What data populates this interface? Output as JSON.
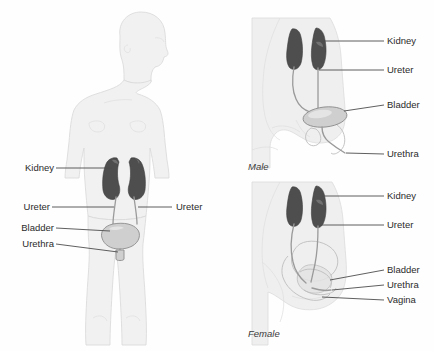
{
  "figure": {
    "background_color": "#ffffff",
    "label_color": "#2b2b2b",
    "leader_color": "#4d4d4d",
    "organ_colors": {
      "kidney": "#4e4e4e",
      "ureter": "#9a9a9a",
      "bladder": "#cfcfcf",
      "urethra": "#9a9a9a",
      "body": "#f1f1f1"
    }
  },
  "panels": {
    "full_body": {
      "caption": "",
      "labels_left": [
        {
          "text": "Kidney",
          "x": 20,
          "y": 171
        },
        {
          "text": "Ureter",
          "x": 20,
          "y": 210
        },
        {
          "text": "Bladder",
          "x": 16,
          "y": 231
        },
        {
          "text": "Urethra",
          "x": 16,
          "y": 247
        }
      ],
      "labels_right": [
        {
          "text": "Ureter",
          "x": 176,
          "y": 210
        }
      ]
    },
    "male": {
      "caption": "Male",
      "caption_x": 248,
      "caption_y": 170,
      "labels": [
        {
          "text": "Kidney",
          "x": 387,
          "y": 44
        },
        {
          "text": "Ureter",
          "x": 387,
          "y": 73
        },
        {
          "text": "Bladder",
          "x": 387,
          "y": 108
        },
        {
          "text": "Urethra",
          "x": 387,
          "y": 157
        }
      ]
    },
    "female": {
      "caption": "Female",
      "caption_x": 248,
      "caption_y": 337,
      "labels": [
        {
          "text": "Kidney",
          "x": 387,
          "y": 199
        },
        {
          "text": "Ureter",
          "x": 387,
          "y": 228
        },
        {
          "text": "Bladder",
          "x": 387,
          "y": 273
        },
        {
          "text": "Urethra",
          "x": 387,
          "y": 288
        },
        {
          "text": "Vagina",
          "x": 387,
          "y": 303
        }
      ]
    }
  },
  "icons": {
    "kidney": "kidney-icon",
    "ureter": "ureter-icon",
    "bladder": "bladder-icon",
    "urethra": "urethra-icon",
    "vagina": "vagina-icon"
  }
}
